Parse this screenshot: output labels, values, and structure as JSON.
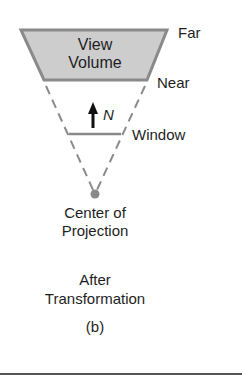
{
  "figure": {
    "view_volume_label_line1": "View",
    "view_volume_label_line2": "Volume",
    "far_label": "Far",
    "near_label": "Near",
    "normal_label": "N",
    "window_label": "Window",
    "cop_label_line1": "Center of",
    "cop_label_line2": "Projection",
    "caption_line1": "After",
    "caption_line2": "Transformation",
    "subfigure_label": "(b)"
  },
  "colors": {
    "volume_fill": "#c8c8c8",
    "edge": "#8a8a8a",
    "text": "#1e1e1e"
  }
}
